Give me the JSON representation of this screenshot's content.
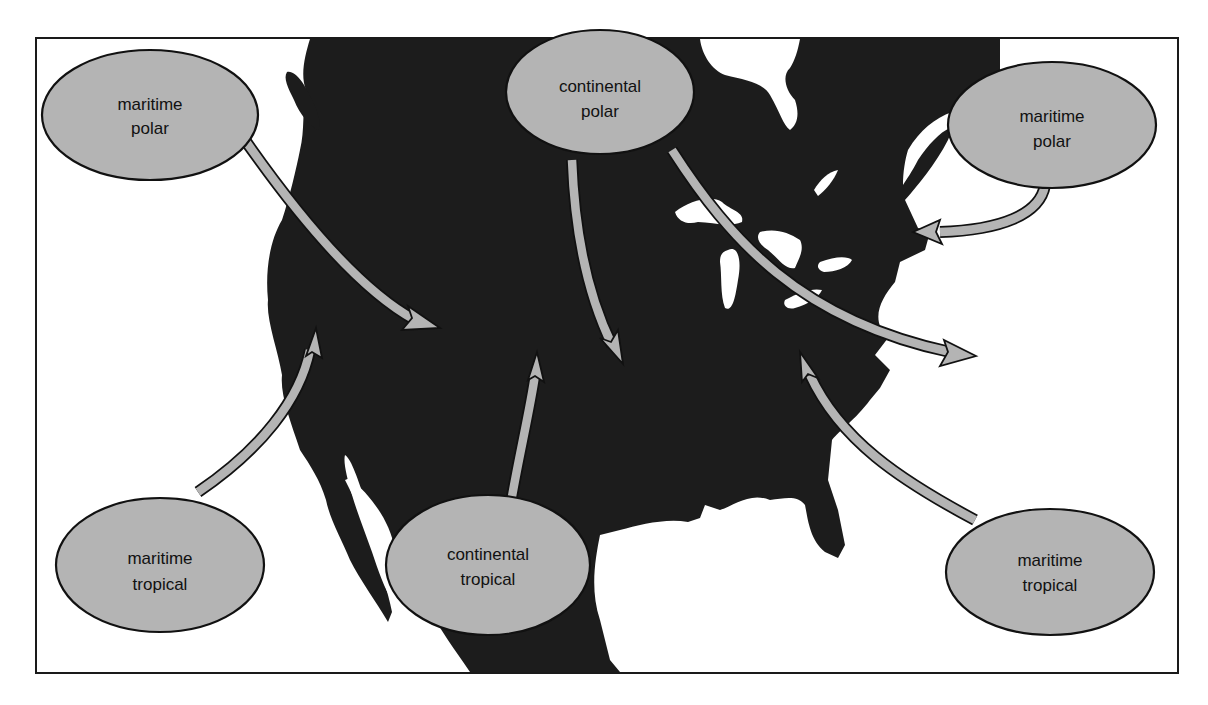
{
  "diagram": {
    "colors": {
      "land": "#1c1c1c",
      "bubble_fill": "#b4b4b4",
      "outline": "#111111",
      "background": "#ffffff"
    },
    "air_masses": [
      {
        "id": "mp-west",
        "line1": "maritime",
        "line2": "polar"
      },
      {
        "id": "cp",
        "line1": "continental",
        "line2": "polar"
      },
      {
        "id": "mp-east",
        "line1": "maritime",
        "line2": "polar"
      },
      {
        "id": "mt-west",
        "line1": "maritime",
        "line2": "tropical"
      },
      {
        "id": "ct",
        "line1": "continental",
        "line2": "tropical"
      },
      {
        "id": "mt-east",
        "line1": "maritime",
        "line2": "tropical"
      }
    ]
  }
}
